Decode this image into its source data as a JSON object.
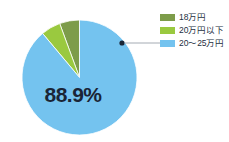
{
  "caption_fragment": "",
  "chart_data": {
    "type": "pie",
    "title": "",
    "categories": [
      "18万円",
      "20万円以下",
      "20〜25万円"
    ],
    "values": [
      5.6,
      5.5,
      88.9
    ],
    "unit": "%",
    "colors": [
      "#7d9c4a",
      "#9ac93f",
      "#74c3ef"
    ],
    "data_labels": [
      {
        "category": "20〜25万円",
        "text": "88.9%",
        "value": 88.9
      }
    ],
    "legend": {
      "position": "right",
      "entries": [
        {
          "label": "18万円",
          "color": "#7d9c4a"
        },
        {
          "label": "20万円以下",
          "color": "#9ac93f"
        },
        {
          "label": "20〜25万円",
          "color": "#74c3ef"
        }
      ]
    },
    "annotations": [
      {
        "type": "leader-line",
        "from": "20〜25万円 slice",
        "to": "legend entry 20〜25万円"
      }
    ],
    "start_angle_deg": -90,
    "direction": "counterclockwise",
    "grid": false
  },
  "pie": {
    "center_label": "88.9%"
  },
  "legend": {
    "items": [
      {
        "label": "18万円",
        "color": "#7d9c4a"
      },
      {
        "label": "20万円以下",
        "color": "#9ac93f"
      },
      {
        "label": "20〜25万円",
        "color": "#74c3ef"
      }
    ]
  }
}
